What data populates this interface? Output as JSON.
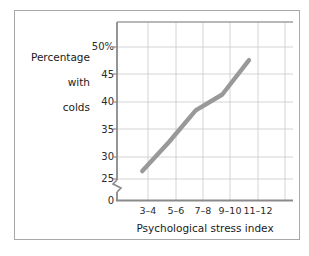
{
  "chart_data": {
    "type": "line",
    "title": "",
    "xlabel": "Psychological stress index",
    "ylabel": "Percentage with colds",
    "ylabel_lines": [
      "Percentage",
      "with",
      "colds"
    ],
    "categories": [
      "3–4",
      "5–6",
      "7–8",
      "9–10",
      "11–12"
    ],
    "values": [
      26.5,
      32,
      38,
      41,
      47.5
    ],
    "series": [
      {
        "name": "Percentage with colds",
        "values": [
          26.5,
          32,
          38,
          41,
          47.5
        ],
        "color": "#999999"
      }
    ],
    "yticks": [
      "0",
      "25",
      "30",
      "35",
      "40",
      "45",
      "50%"
    ],
    "ytick_values": [
      0,
      25,
      30,
      35,
      40,
      45,
      50
    ],
    "ylim": [
      25,
      50
    ],
    "y_axis_break": true,
    "y_axis_break_note": "axis break between 0 and 25",
    "grid": true,
    "legend": "none",
    "line_color": "#999999",
    "grid_color": "#c9c9c9",
    "axis_color": "#a0a0a0",
    "frame_color": "#a8a8a8"
  },
  "axis": {
    "y_label_line1": "Percentage",
    "y_label_line2": "with",
    "y_label_line3": "colds",
    "x_title": "Psychological stress index"
  },
  "yticks": {
    "t50": "50%",
    "t45": "45",
    "t40": "40",
    "t35": "35",
    "t30": "30",
    "t25": "25",
    "t0": "0"
  },
  "xticks": {
    "x0": "3–4",
    "x1": "5–6",
    "x2": "7–8",
    "x3": "9–10",
    "x4": "11–12"
  }
}
